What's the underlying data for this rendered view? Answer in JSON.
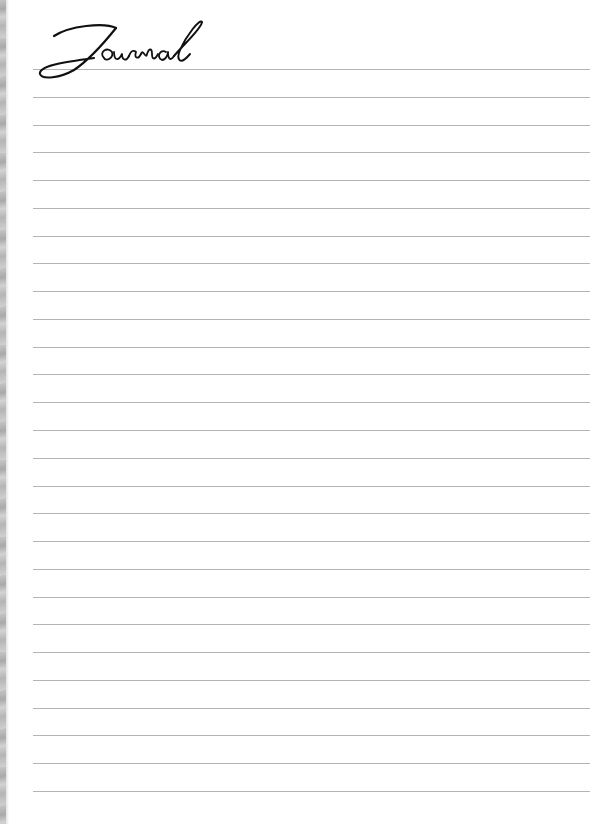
{
  "page": {
    "title": "Journal",
    "line_count": 27,
    "first_line_y": 69,
    "line_spacing": 27.77,
    "line_left": 33,
    "line_width": 557,
    "line_color": "#b4b4b4",
    "ink_color": "#111111",
    "edge_color": "#b5b5b5"
  }
}
